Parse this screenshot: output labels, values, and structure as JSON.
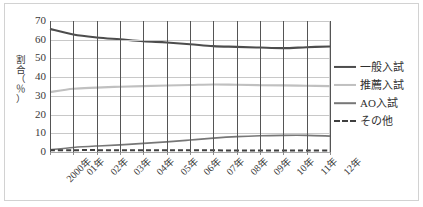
{
  "chart_data": {
    "type": "line",
    "title": "",
    "subtitle": "",
    "xlabel": "",
    "ylabel": "割合（％）",
    "ylabel_chars": [
      "割",
      "合",
      "（",
      "％",
      "）"
    ],
    "ylim": [
      0,
      70
    ],
    "yticks": [
      70,
      60,
      50,
      40,
      30,
      20,
      10,
      0
    ],
    "grid": "horizontal-and-vertical",
    "legend_position": "right",
    "categories": [
      "2000年",
      "01年",
      "02年",
      "03年",
      "04年",
      "05年",
      "06年",
      "07年",
      "08年",
      "09年",
      "10年",
      "11年",
      "12年"
    ],
    "series": [
      {
        "name": "一般入試",
        "color": "#4d4d4d",
        "style": "solid",
        "width": 2.1,
        "values": [
          65.8,
          62.8,
          61.2,
          60.2,
          59.2,
          58.5,
          57.6,
          56.6,
          56.2,
          55.8,
          55.5,
          56.0,
          56.4
        ]
      },
      {
        "name": "推薦入試",
        "color": "#c0c0c0",
        "style": "solid",
        "width": 2.1,
        "values": [
          32.0,
          33.8,
          34.4,
          34.9,
          35.2,
          35.5,
          35.8,
          36.1,
          35.9,
          35.7,
          35.6,
          35.4,
          35.2
        ]
      },
      {
        "name": "AO入試",
        "color": "#777777",
        "style": "solid",
        "width": 1.6,
        "values": [
          1.2,
          2.4,
          3.2,
          3.8,
          4.6,
          5.4,
          6.4,
          7.4,
          8.2,
          8.7,
          8.9,
          8.9,
          8.5
        ]
      },
      {
        "name": "その他",
        "color": "#3f3f3f",
        "style": "dashed",
        "width": 2.0,
        "values": [
          1.0,
          1.0,
          1.0,
          0.9,
          1.0,
          0.9,
          0.9,
          0.9,
          0.8,
          0.8,
          0.8,
          0.8,
          0.8
        ]
      }
    ]
  },
  "legend": {
    "items": [
      {
        "label": "一般入試"
      },
      {
        "label": "推薦入試"
      },
      {
        "label": "AO入試"
      },
      {
        "label": "その他"
      }
    ]
  }
}
